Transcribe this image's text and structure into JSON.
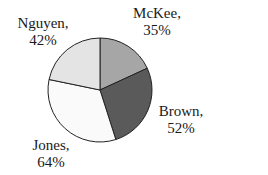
{
  "chart_data": {
    "type": "pie",
    "title": "",
    "categories": [
      "McKee",
      "Brown",
      "Jones",
      "Nguyen"
    ],
    "values": [
      35,
      52,
      64,
      42
    ],
    "labels": [
      "35%",
      "52%",
      "64%",
      "42%"
    ],
    "colors": [
      "#a6a6a6",
      "#5a5a5a",
      "#fafafa",
      "#e4e4e4"
    ],
    "start_angle_deg": 0,
    "direction": "clockwise",
    "legend": "none",
    "data_labels": "category, percent (outside)"
  },
  "labels": {
    "mckee": {
      "name": "McKee,",
      "pct": "35%"
    },
    "brown": {
      "name": "Brown,",
      "pct": "52%"
    },
    "jones": {
      "name": "Jones,",
      "pct": "64%"
    },
    "nguyen": {
      "name": "Nguyen,",
      "pct": "42%"
    }
  }
}
